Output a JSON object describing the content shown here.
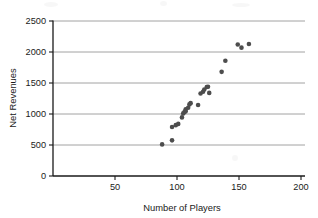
{
  "chart_data": {
    "type": "scatter",
    "title": "",
    "xlabel": "Number of Players",
    "ylabel": "Net Revenues",
    "xlim": [
      0,
      200
    ],
    "ylim": [
      0,
      2500
    ],
    "xticks": [
      50,
      100,
      150,
      200
    ],
    "yticks": [
      0,
      500,
      1000,
      1500,
      2000,
      2500
    ],
    "grid": "horizontal",
    "legend": "none",
    "marker_color": "#4d4d4d",
    "points": [
      {
        "x": 88,
        "y": 510
      },
      {
        "x": 96,
        "y": 575
      },
      {
        "x": 96,
        "y": 790
      },
      {
        "x": 99,
        "y": 820
      },
      {
        "x": 101,
        "y": 840
      },
      {
        "x": 104,
        "y": 945
      },
      {
        "x": 105,
        "y": 1010
      },
      {
        "x": 106,
        "y": 1030
      },
      {
        "x": 107,
        "y": 1045
      },
      {
        "x": 107,
        "y": 1075
      },
      {
        "x": 109,
        "y": 1100
      },
      {
        "x": 110,
        "y": 1155
      },
      {
        "x": 111,
        "y": 1175
      },
      {
        "x": 117,
        "y": 1145
      },
      {
        "x": 119,
        "y": 1330
      },
      {
        "x": 121,
        "y": 1360
      },
      {
        "x": 122,
        "y": 1395
      },
      {
        "x": 124,
        "y": 1435
      },
      {
        "x": 125,
        "y": 1440
      },
      {
        "x": 126,
        "y": 1340
      },
      {
        "x": 136,
        "y": 1680
      },
      {
        "x": 139,
        "y": 1860
      },
      {
        "x": 149,
        "y": 2120
      },
      {
        "x": 152,
        "y": 2070
      },
      {
        "x": 158,
        "y": 2130
      }
    ]
  }
}
